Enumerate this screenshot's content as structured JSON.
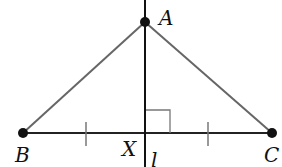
{
  "diagram": {
    "type": "geometry",
    "points": {
      "A": {
        "label": "A",
        "x": 145,
        "y": 22
      },
      "B": {
        "label": "B",
        "x": 23,
        "y": 133
      },
      "C": {
        "label": "C",
        "x": 272,
        "y": 133
      },
      "X": {
        "label": "X",
        "x": 145,
        "y": 133
      }
    },
    "line_label": "l",
    "segments": [
      "AB",
      "AC",
      "BC"
    ],
    "marks": {
      "right_angle_at": "X",
      "congruent_ticks": [
        "BX",
        "XC"
      ]
    },
    "colors": {
      "triangle_sides": "#666666",
      "base_and_line": "#111111",
      "points": "#111111"
    }
  }
}
